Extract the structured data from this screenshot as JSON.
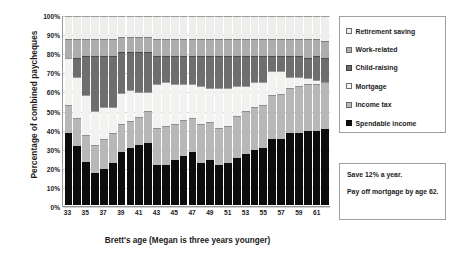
{
  "chart_data": {
    "type": "bar",
    "subtype": "stacked-100-percent",
    "title": "",
    "xlabel": "Brett's age (Megan is three years younger)",
    "ylabel": "Percentage of combined paycheques",
    "ylim": [
      0,
      100
    ],
    "ytick_labels": [
      "0%",
      "10%",
      "20%",
      "30%",
      "40%",
      "50%",
      "60%",
      "70%",
      "80%",
      "90%",
      "100%"
    ],
    "ytick_values": [
      0,
      10,
      20,
      30,
      40,
      50,
      60,
      70,
      80,
      90,
      100
    ],
    "grid": true,
    "legend_position": "right",
    "categories": [
      33,
      34,
      35,
      36,
      37,
      38,
      39,
      40,
      41,
      42,
      43,
      44,
      45,
      46,
      47,
      48,
      49,
      50,
      51,
      52,
      53,
      54,
      55,
      56,
      57,
      58,
      59,
      60,
      61,
      62
    ],
    "xtick_labels": [
      "33",
      "35",
      "37",
      "39",
      "41",
      "43",
      "45",
      "47",
      "49",
      "51",
      "53",
      "55",
      "57",
      "59",
      "61"
    ],
    "series": [
      {
        "name": "Spendable income",
        "color": "#0d0d0d",
        "values": [
          38,
          31,
          23,
          17,
          19,
          22,
          31,
          33,
          35,
          36,
          21,
          21,
          24,
          26,
          28,
          22,
          24,
          21,
          22,
          25,
          27,
          29,
          30,
          35,
          35,
          38,
          38,
          39,
          39,
          40
        ]
      },
      {
        "name": "Income tax",
        "color": "#b8b8b8",
        "values": [
          15,
          15,
          14,
          15,
          16,
          16,
          16,
          16,
          16,
          18,
          20,
          21,
          19,
          19,
          18,
          21,
          20,
          20,
          20,
          22,
          23,
          23,
          23,
          23,
          24,
          24,
          25,
          25,
          25,
          25
        ]
      },
      {
        "name": "Mortgage",
        "color": "#f2f2f0",
        "values": [
          25,
          22,
          21,
          18,
          17,
          14,
          18,
          18,
          15,
          11,
          23,
          23,
          21,
          19,
          18,
          20,
          18,
          21,
          20,
          16,
          13,
          13,
          12,
          13,
          12,
          6,
          5,
          3,
          2,
          0
        ]
      },
      {
        "name": "Child-raising",
        "color": "#6e6e6e",
        "values": [
          0,
          10,
          21,
          29,
          27,
          27,
          24,
          22,
          23,
          23,
          15,
          14,
          15,
          15,
          15,
          16,
          17,
          17,
          17,
          16,
          16,
          14,
          14,
          8,
          8,
          11,
          11,
          11,
          13,
          13
        ]
      },
      {
        "name": "Work-related",
        "color": "#adadad",
        "values": [
          10,
          10,
          9,
          9,
          9,
          9,
          9,
          9,
          9,
          9,
          9,
          9,
          9,
          9,
          9,
          9,
          9,
          9,
          9,
          9,
          9,
          9,
          9,
          9,
          9,
          9,
          9,
          10,
          9,
          9
        ]
      },
      {
        "name": "Retirement saving",
        "color": "#eeeeec",
        "values": [
          12,
          12,
          12,
          12,
          12,
          12,
          12,
          12,
          12,
          12,
          12,
          12,
          12,
          12,
          12,
          12,
          12,
          12,
          12,
          12,
          12,
          12,
          12,
          12,
          12,
          12,
          12,
          12,
          12,
          13
        ]
      }
    ]
  },
  "legend": {
    "items": [
      {
        "label": "Retirement saving",
        "key": "ret"
      },
      {
        "label": "Work-related",
        "key": "work"
      },
      {
        "label": "Child-raising",
        "key": "child"
      },
      {
        "label": "Mortgage",
        "key": "mort"
      },
      {
        "label": "Income tax",
        "key": "tax"
      },
      {
        "label": "Spendable income",
        "key": "spend"
      }
    ]
  },
  "notes": {
    "line1": "Save 12% a year.",
    "line2": "Pay off mortgage by age 62."
  }
}
